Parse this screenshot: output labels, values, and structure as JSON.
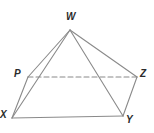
{
  "figure": {
    "type": "geometry-diagram",
    "canvas": {
      "width": 154,
      "height": 133
    },
    "background_color": "#ffffff",
    "stroke_color": "#8a8a8a",
    "label_color": "#2b2b2b",
    "stroke_width": 1.1
  },
  "vertices": [
    {
      "id": "W",
      "label": "W",
      "x": 70,
      "y": 30,
      "label_x": 66,
      "label_y": 12
    },
    {
      "id": "P",
      "label": "P",
      "x": 28,
      "y": 77,
      "label_x": 14,
      "label_y": 69
    },
    {
      "id": "Z",
      "label": "Z",
      "x": 137,
      "y": 77,
      "label_x": 140,
      "label_y": 69
    },
    {
      "id": "X",
      "label": "X",
      "x": 12,
      "y": 118,
      "label_x": 0,
      "label_y": 110
    },
    {
      "id": "Y",
      "label": "Y",
      "x": 123,
      "y": 116,
      "label_x": 126,
      "label_y": 115
    }
  ],
  "edges": [
    {
      "id": "WP",
      "from": "W",
      "to": "P",
      "style": "solid"
    },
    {
      "id": "WX",
      "from": "W",
      "to": "X",
      "style": "solid"
    },
    {
      "id": "WY",
      "from": "W",
      "to": "Y",
      "style": "solid"
    },
    {
      "id": "WZ",
      "from": "W",
      "to": "Z",
      "style": "solid"
    },
    {
      "id": "PX",
      "from": "P",
      "to": "X",
      "style": "solid"
    },
    {
      "id": "XY",
      "from": "X",
      "to": "Y",
      "style": "solid"
    },
    {
      "id": "YZ",
      "from": "Y",
      "to": "Z",
      "style": "solid"
    },
    {
      "id": "PZ",
      "from": "P",
      "to": "Z",
      "style": "dashed"
    }
  ]
}
